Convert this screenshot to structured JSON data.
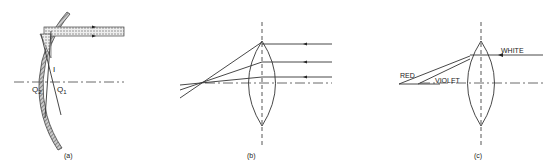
{
  "figure": {
    "panels": [
      {
        "id": "a",
        "caption": "(a)",
        "description": "Concave spherical mirror with incident parallel beam; spherical aberration",
        "labels": {
          "image": "I",
          "focus_2": "Q2",
          "focus_1": "Q1"
        },
        "label_parts": {
          "q2_main": "Q",
          "q2_sub": "2",
          "q1_main": "Q",
          "q1_sub": "1"
        }
      },
      {
        "id": "b",
        "caption": "(b)",
        "description": "Converging lens with parallel rays at different heights focusing at different points (spherical aberration)"
      },
      {
        "id": "c",
        "caption": "(c)",
        "description": "Converging lens dispersing white light into red and violet (chromatic aberration)",
        "labels": {
          "incoming": "WHITE",
          "ray_1": "RED",
          "ray_2": "VIOLET"
        }
      }
    ],
    "colors": {
      "line": "#333333",
      "mirror_hatch": "#777777",
      "beam_fill": "#bdbdbd",
      "background": "#ffffff"
    }
  }
}
